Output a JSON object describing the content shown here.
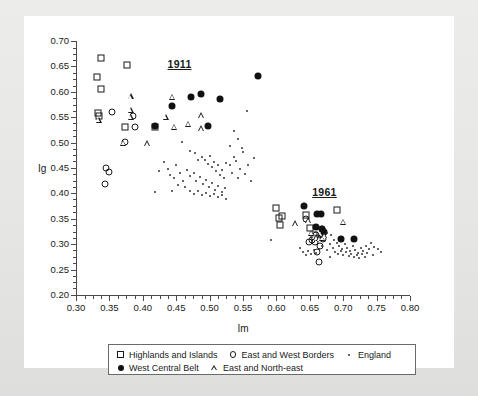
{
  "chart_data": {
    "type": "scatter",
    "title": "",
    "xlabel": "Im",
    "ylabel": "Ig",
    "xlim": [
      0.3,
      0.8
    ],
    "ylim": [
      0.2,
      0.7
    ],
    "xticks": [
      "0.30",
      "0.35",
      "0.40",
      "0.45",
      "0.50",
      "0.55",
      "0.60",
      "0.65",
      "0.70",
      "0.75",
      "0.80"
    ],
    "yticks": [
      "0.70",
      "0.65",
      "0.60",
      "0.55",
      "0.50",
      "0.45",
      "0.40",
      "0.35",
      "0.30",
      "0.25",
      "0.20"
    ],
    "xtick_values": [
      0.3,
      0.35,
      0.4,
      0.45,
      0.5,
      0.55,
      0.6,
      0.65,
      0.7,
      0.75,
      0.8
    ],
    "ytick_values": [
      0.7,
      0.65,
      0.6,
      0.55,
      0.5,
      0.45,
      0.4,
      0.35,
      0.3,
      0.25,
      0.2
    ],
    "grid": false,
    "minor_ticks": true,
    "legend_position": "below-axes",
    "annotations": [
      {
        "text": "1911",
        "x": 0.455,
        "y": 0.654
      },
      {
        "text": "1961",
        "x": 0.672,
        "y": 0.402
      }
    ],
    "series": [
      {
        "name": "Highlands and Islands",
        "marker": "open-square",
        "values": [
          [
            0.338,
            0.667
          ],
          [
            0.332,
            0.629
          ],
          [
            0.337,
            0.606
          ],
          [
            0.333,
            0.558
          ],
          [
            0.334,
            0.552
          ],
          [
            0.376,
            0.652
          ],
          [
            0.374,
            0.53
          ],
          [
            0.418,
            0.531
          ],
          [
            0.599,
            0.372
          ],
          [
            0.609,
            0.355
          ],
          [
            0.604,
            0.352
          ],
          [
            0.606,
            0.337
          ],
          [
            0.644,
            0.357
          ],
          [
            0.651,
            0.331
          ],
          [
            0.656,
            0.318
          ],
          [
            0.691,
            0.368
          ]
        ]
      },
      {
        "name": "East and West Borders",
        "marker": "open-circle",
        "values": [
          [
            0.354,
            0.561
          ],
          [
            0.386,
            0.553
          ],
          [
            0.389,
            0.531
          ],
          [
            0.374,
            0.502
          ],
          [
            0.345,
            0.45
          ],
          [
            0.349,
            0.443
          ],
          [
            0.343,
            0.419
          ],
          [
            0.645,
            0.349
          ],
          [
            0.66,
            0.319
          ],
          [
            0.662,
            0.313
          ],
          [
            0.653,
            0.308
          ],
          [
            0.649,
            0.305
          ],
          [
            0.658,
            0.305
          ],
          [
            0.668,
            0.33
          ],
          [
            0.67,
            0.31
          ],
          [
            0.665,
            0.297
          ],
          [
            0.661,
            0.285
          ],
          [
            0.664,
            0.265
          ]
        ]
      },
      {
        "name": "West Central Belt",
        "marker": "filled-circle",
        "values": [
          [
            0.418,
            0.533
          ],
          [
            0.443,
            0.572
          ],
          [
            0.472,
            0.59
          ],
          [
            0.487,
            0.596
          ],
          [
            0.497,
            0.533
          ],
          [
            0.515,
            0.586
          ],
          [
            0.572,
            0.632
          ],
          [
            0.641,
            0.376
          ],
          [
            0.661,
            0.359
          ],
          [
            0.667,
            0.36
          ],
          [
            0.659,
            0.334
          ],
          [
            0.668,
            0.329
          ],
          [
            0.671,
            0.325
          ],
          [
            0.696,
            0.311
          ],
          [
            0.716,
            0.31
          ]
        ]
      },
      {
        "name": "East and North-east",
        "marker": "open-triangle",
        "values": [
          [
            0.334,
            0.545
          ],
          [
            0.382,
            0.591
          ],
          [
            0.382,
            0.565
          ],
          [
            0.382,
            0.551
          ],
          [
            0.371,
            0.5
          ],
          [
            0.406,
            0.499
          ],
          [
            0.444,
            0.59
          ],
          [
            0.434,
            0.551
          ],
          [
            0.447,
            0.531
          ],
          [
            0.468,
            0.537
          ],
          [
            0.487,
            0.554
          ],
          [
            0.487,
            0.528
          ],
          [
            0.628,
            0.341
          ],
          [
            0.648,
            0.347
          ],
          [
            0.652,
            0.323
          ],
          [
            0.656,
            0.315
          ],
          [
            0.66,
            0.314
          ],
          [
            0.664,
            0.312
          ],
          [
            0.668,
            0.313
          ],
          [
            0.672,
            0.318
          ],
          [
            0.7,
            0.344
          ]
        ]
      },
      {
        "name": "England",
        "marker": "small-dot",
        "values": [
          [
            0.458,
            0.502
          ],
          [
            0.47,
            0.483
          ],
          [
            0.478,
            0.479
          ],
          [
            0.483,
            0.465
          ],
          [
            0.488,
            0.472
          ],
          [
            0.493,
            0.466
          ],
          [
            0.497,
            0.458
          ],
          [
            0.5,
            0.474
          ],
          [
            0.504,
            0.451
          ],
          [
            0.507,
            0.462
          ],
          [
            0.509,
            0.444
          ],
          [
            0.512,
            0.455
          ],
          [
            0.515,
            0.437
          ],
          [
            0.518,
            0.447
          ],
          [
            0.521,
            0.43
          ],
          [
            0.524,
            0.459
          ],
          [
            0.466,
            0.447
          ],
          [
            0.471,
            0.434
          ],
          [
            0.476,
            0.441
          ],
          [
            0.48,
            0.424
          ],
          [
            0.485,
            0.432
          ],
          [
            0.49,
            0.419
          ],
          [
            0.495,
            0.427
          ],
          [
            0.499,
            0.412
          ],
          [
            0.503,
            0.421
          ],
          [
            0.508,
            0.407
          ],
          [
            0.513,
            0.415
          ],
          [
            0.518,
            0.402
          ],
          [
            0.523,
            0.41
          ],
          [
            0.45,
            0.455
          ],
          [
            0.455,
            0.441
          ],
          [
            0.46,
            0.425
          ],
          [
            0.463,
            0.412
          ],
          [
            0.447,
            0.43
          ],
          [
            0.452,
            0.417
          ],
          [
            0.444,
            0.405
          ],
          [
            0.47,
            0.405
          ],
          [
            0.476,
            0.398
          ],
          [
            0.482,
            0.404
          ],
          [
            0.488,
            0.396
          ],
          [
            0.494,
            0.401
          ],
          [
            0.5,
            0.394
          ],
          [
            0.506,
            0.399
          ],
          [
            0.512,
            0.392
          ],
          [
            0.518,
            0.396
          ],
          [
            0.524,
            0.389
          ],
          [
            0.53,
            0.455
          ],
          [
            0.534,
            0.441
          ],
          [
            0.537,
            0.472
          ],
          [
            0.54,
            0.463
          ],
          [
            0.543,
            0.43
          ],
          [
            0.546,
            0.448
          ],
          [
            0.55,
            0.481
          ],
          [
            0.553,
            0.438
          ],
          [
            0.558,
            0.456
          ],
          [
            0.562,
            0.425
          ],
          [
            0.566,
            0.47
          ],
          [
            0.536,
            0.522
          ],
          [
            0.542,
            0.508
          ],
          [
            0.556,
            0.563
          ],
          [
            0.548,
            0.49
          ],
          [
            0.53,
            0.494
          ],
          [
            0.418,
            0.402
          ],
          [
            0.432,
            0.462
          ],
          [
            0.437,
            0.448
          ],
          [
            0.441,
            0.437
          ],
          [
            0.424,
            0.445
          ],
          [
            0.676,
            0.323
          ],
          [
            0.682,
            0.318
          ],
          [
            0.686,
            0.309
          ],
          [
            0.69,
            0.302
          ],
          [
            0.694,
            0.297
          ],
          [
            0.698,
            0.291
          ],
          [
            0.702,
            0.3
          ],
          [
            0.706,
            0.293
          ],
          [
            0.71,
            0.287
          ],
          [
            0.714,
            0.296
          ],
          [
            0.718,
            0.289
          ],
          [
            0.722,
            0.283
          ],
          [
            0.726,
            0.292
          ],
          [
            0.73,
            0.286
          ],
          [
            0.734,
            0.297
          ],
          [
            0.738,
            0.29
          ],
          [
            0.742,
            0.303
          ],
          [
            0.746,
            0.295
          ],
          [
            0.68,
            0.3
          ],
          [
            0.684,
            0.292
          ],
          [
            0.688,
            0.285
          ],
          [
            0.692,
            0.281
          ],
          [
            0.696,
            0.286
          ],
          [
            0.7,
            0.279
          ],
          [
            0.704,
            0.284
          ],
          [
            0.708,
            0.277
          ],
          [
            0.712,
            0.281
          ],
          [
            0.716,
            0.275
          ],
          [
            0.72,
            0.279
          ],
          [
            0.724,
            0.273
          ],
          [
            0.728,
            0.28
          ],
          [
            0.732,
            0.274
          ],
          [
            0.736,
            0.282
          ],
          [
            0.672,
            0.306
          ],
          [
            0.668,
            0.296
          ],
          [
            0.664,
            0.29
          ],
          [
            0.66,
            0.283
          ],
          [
            0.656,
            0.289
          ],
          [
            0.652,
            0.281
          ],
          [
            0.648,
            0.287
          ],
          [
            0.644,
            0.279
          ],
          [
            0.64,
            0.285
          ],
          [
            0.636,
            0.292
          ],
          [
            0.676,
            0.288
          ],
          [
            0.68,
            0.275
          ],
          [
            0.752,
            0.29
          ],
          [
            0.756,
            0.284
          ],
          [
            0.745,
            0.279
          ],
          [
            0.592,
            0.308
          ]
        ]
      }
    ]
  },
  "legend": {
    "rows": [
      [
        {
          "label": "Highlands and Islands",
          "marker": "open-square"
        },
        {
          "label": "East and West Borders",
          "marker": "open-circle"
        },
        {
          "label": "England",
          "marker": "small-dot"
        }
      ],
      [
        {
          "label": "West Central Belt",
          "marker": "filled-circle"
        },
        {
          "label": "East and North-east",
          "marker": "open-triangle"
        }
      ]
    ]
  }
}
